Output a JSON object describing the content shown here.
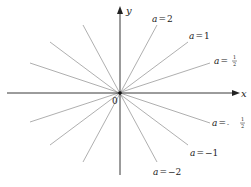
{
  "diagram": {
    "axes": {
      "x_label": "x",
      "y_label": "y",
      "origin_label": "0"
    },
    "origin_px": [
      120,
      93
    ],
    "line_color": "#9a9a9a",
    "axis_color": "#222222",
    "lines": [
      {
        "a": "2",
        "label_var": "a",
        "label_eq": "=",
        "label_val": "2",
        "slope": 2,
        "labeled": true
      },
      {
        "a": "1",
        "label_var": "a",
        "label_eq": "=",
        "label_val": "1",
        "slope": 1,
        "labeled": true
      },
      {
        "a": "1/2",
        "label_var": "a",
        "label_eq": "=",
        "label_val_num": "1",
        "label_val_den": "2",
        "slope": 0.5,
        "labeled": true
      },
      {
        "a": "-1/2",
        "label_var": "a",
        "label_eq": "=",
        "label_sign": "-",
        "label_val_num": "1",
        "label_val_den": "2",
        "slope": -0.5,
        "labeled": true
      },
      {
        "a": "-1",
        "label_var": "a",
        "label_eq": "=",
        "label_val": "−1",
        "slope": -1,
        "labeled": true
      },
      {
        "a": "-2",
        "label_var": "a",
        "label_eq": "=",
        "label_val": "−2",
        "slope": -2,
        "labeled": true
      }
    ]
  }
}
